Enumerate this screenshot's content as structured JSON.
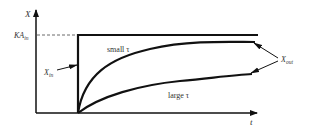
{
  "diagram": {
    "type": "step-response-plot",
    "axes": {
      "y_label": "X",
      "x_label": "t"
    },
    "level_label_main": "KA",
    "level_label_sub": "in",
    "curves": {
      "small_tau_label": "small τ",
      "large_tau_label": "large τ"
    },
    "annotations": {
      "input_main": "X",
      "input_sub": "in",
      "output_main": "X",
      "output_sub": "out"
    },
    "colors": {
      "line": "#111111",
      "text": "#333333",
      "dashed": "#444444"
    }
  }
}
